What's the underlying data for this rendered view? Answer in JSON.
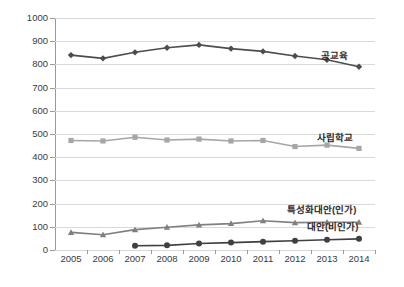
{
  "chart_data": {
    "type": "line",
    "title": "",
    "xlabel": "",
    "ylabel": "",
    "categories": [
      "2005",
      "2006",
      "2007",
      "2008",
      "2009",
      "2010",
      "2011",
      "2012",
      "2013",
      "2014"
    ],
    "ylim": [
      0,
      1000
    ],
    "ytick_step": 100,
    "yticks": [
      "0",
      "100",
      "200",
      "300",
      "400",
      "500",
      "600",
      "700",
      "800",
      "900",
      "1000"
    ],
    "grid": true,
    "legend_position": "inline-right",
    "series": [
      {
        "name": "공교육",
        "color": "#4d4d4d",
        "marker": "diamond",
        "values": [
          840,
          826,
          852,
          872,
          884,
          868,
          856,
          836,
          820,
          790
        ]
      },
      {
        "name": "사립학교",
        "color": "#a6a6a6",
        "marker": "square",
        "values": [
          472,
          470,
          486,
          474,
          478,
          470,
          472,
          446,
          452,
          438
        ]
      },
      {
        "name": "특성화대안(인가)",
        "color": "#808080",
        "marker": "triangle",
        "values": [
          76,
          66,
          88,
          98,
          108,
          114,
          126,
          118,
          120,
          120
        ]
      },
      {
        "name": "대안(비인가)",
        "color": "#404040",
        "marker": "circle",
        "values": [
          null,
          null,
          18,
          20,
          28,
          32,
          36,
          40,
          44,
          48
        ]
      }
    ]
  },
  "axis": {
    "y_labels": [
      "1000",
      "900",
      "800",
      "700",
      "600",
      "500",
      "400",
      "300",
      "200",
      "100",
      "0"
    ],
    "x_labels": [
      "2005",
      "2006",
      "2007",
      "2008",
      "2009",
      "2010",
      "2011",
      "2012",
      "2013",
      "2014"
    ]
  },
  "labels": {
    "public_education": "공교육",
    "private_school": "사립학교",
    "specialized_alternative": "특성화대안(인가)",
    "alternative_unauthorized": "대안(비인가)"
  }
}
